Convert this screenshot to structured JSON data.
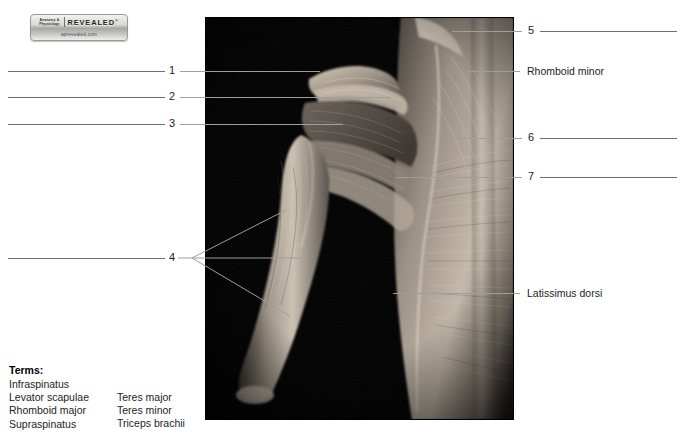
{
  "logo": {
    "brand_line1": "Anatomy &",
    "brand_line2": "Physiology",
    "brand_main": "REVEALED",
    "trademark": "®",
    "url": "aprevealed.com",
    "alt": "Anatomy & Physiology Revealed logo"
  },
  "figure": {
    "caption": "Posterior shoulder and back dissection",
    "background_color": "#000000"
  },
  "numbered_labels": [
    {
      "id": "1",
      "number": "1",
      "side": "left",
      "top": 71
    },
    {
      "id": "2",
      "number": "2",
      "side": "left",
      "top": 97
    },
    {
      "id": "3",
      "number": "3",
      "side": "left",
      "top": 124
    },
    {
      "id": "4",
      "number": "4",
      "side": "left",
      "top": 258
    },
    {
      "id": "5",
      "number": "5",
      "side": "right",
      "top": 31
    },
    {
      "id": "6",
      "number": "6",
      "side": "right",
      "top": 138
    },
    {
      "id": "7",
      "number": "7",
      "side": "right",
      "top": 177
    }
  ],
  "identified_labels": [
    {
      "id": "rhomboid-minor",
      "text": "Rhomboid minor",
      "top": 71
    },
    {
      "id": "latissimus-dorsi",
      "text": "Latissimus dorsi",
      "top": 293
    }
  ],
  "terms": {
    "heading": "Terms:",
    "column1": [
      "Infraspinatus",
      "Levator scapulae",
      "Rhomboid major",
      "Supraspinatus"
    ],
    "column2": [
      "Teres major",
      "Teres minor",
      "Triceps brachii"
    ]
  },
  "colors": {
    "rule": "#6e6e6e",
    "leader": "#9e9e9e",
    "text": "#1d1d1d",
    "page_background": "#ffffff"
  }
}
